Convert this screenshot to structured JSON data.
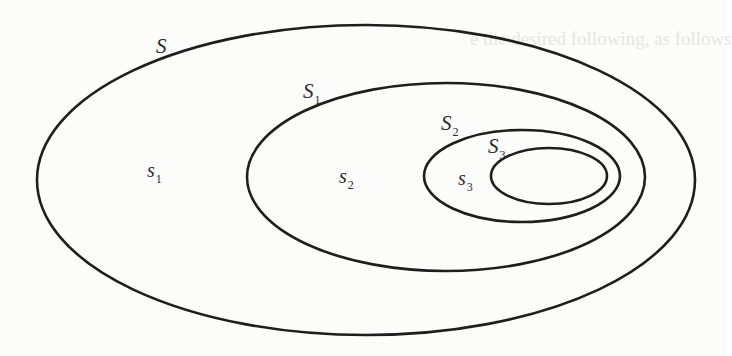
{
  "diagram": {
    "type": "nested-sets",
    "stroke_color": "#1e1e1e",
    "background_color": "#fcfcfb",
    "sets": [
      {
        "id": "S",
        "label_main": "S",
        "label_sub": "",
        "ellipse": {
          "cx": 366,
          "cy": 180,
          "rx": 329,
          "ry": 155
        },
        "label_pos": {
          "x": 156,
          "y": 36
        }
      },
      {
        "id": "S1",
        "label_main": "S",
        "label_sub": "1",
        "ellipse": {
          "cx": 446,
          "cy": 177,
          "rx": 199,
          "ry": 94
        },
        "label_pos": {
          "x": 303,
          "y": 81
        }
      },
      {
        "id": "S2",
        "label_main": "S",
        "label_sub": "2",
        "ellipse": {
          "cx": 522,
          "cy": 176,
          "rx": 98,
          "ry": 46
        },
        "label_pos": {
          "x": 441,
          "y": 113
        }
      },
      {
        "id": "S3",
        "label_main": "S",
        "label_sub": "3",
        "ellipse": {
          "cx": 549,
          "cy": 176,
          "rx": 58,
          "ry": 28
        },
        "label_pos": {
          "x": 488,
          "y": 136
        }
      }
    ],
    "regions": [
      {
        "id": "s1",
        "label_main": "s",
        "label_sub": "1",
        "label_pos": {
          "x": 147,
          "y": 160
        }
      },
      {
        "id": "s2",
        "label_main": "s",
        "label_sub": "2",
        "label_pos": {
          "x": 339,
          "y": 166
        }
      },
      {
        "id": "s3",
        "label_main": "s",
        "label_sub": "3",
        "label_pos": {
          "x": 458,
          "y": 168
        }
      }
    ]
  },
  "bleed_through": {
    "top_fragment": "e the desired following, as follows"
  }
}
